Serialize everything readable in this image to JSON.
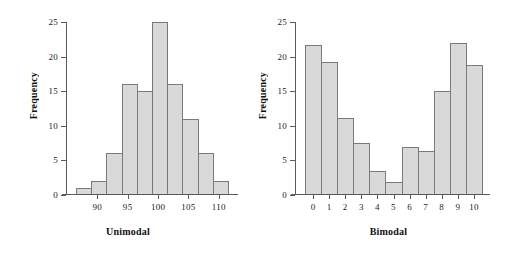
{
  "figure": {
    "background": "#ffffff",
    "bar_fill": "#d9d9d9",
    "bar_border": "#7a7a7a",
    "axis_color": "#5a5a5a"
  },
  "chart_data": [
    {
      "type": "bar",
      "title": "",
      "xlabel": "Unimodal",
      "ylabel": "Frequency",
      "ylim": [
        0,
        25
      ],
      "yticks": [
        0,
        5,
        10,
        15,
        20,
        25
      ],
      "ytick_labels": [
        "0",
        "5",
        "10",
        "15",
        "20",
        "25"
      ],
      "xlim": [
        86.5,
        111.5
      ],
      "xticks": [
        90,
        95,
        100,
        105,
        110
      ],
      "xtick_labels": [
        "90",
        "95",
        "100",
        "105",
        "110"
      ],
      "grid": false,
      "legend": null,
      "bin_edges": [
        86.5,
        89,
        91.5,
        94,
        96.5,
        99,
        101.5,
        104,
        106.5,
        109,
        111.5
      ],
      "categories": [
        "86.5-89",
        "89-91.5",
        "91.5-94",
        "94-96.5",
        "96.5-99",
        "99-101.5",
        "101.5-104",
        "104-106.5",
        "106.5-109",
        "109-111.5"
      ],
      "values": [
        1,
        2,
        6,
        16,
        15,
        25,
        16,
        11,
        6,
        2
      ]
    },
    {
      "type": "bar",
      "title": "",
      "xlabel": "Bimodal",
      "ylabel": "Frequency",
      "ylim": [
        0,
        25
      ],
      "yticks": [
        0,
        5,
        10,
        15,
        20,
        25
      ],
      "ytick_labels": [
        "0",
        "5",
        "10",
        "15",
        "20",
        "25"
      ],
      "xlim": [
        -0.5,
        10.5
      ],
      "xticks": [
        0,
        1,
        2,
        3,
        4,
        5,
        6,
        7,
        8,
        9,
        10
      ],
      "xtick_labels": [
        "0",
        "1",
        "2",
        "3",
        "4",
        "5",
        "6",
        "7",
        "8",
        "9",
        "10"
      ],
      "grid": false,
      "legend": null,
      "categories": [
        "0",
        "1",
        "2",
        "3",
        "4",
        "5",
        "6",
        "7",
        "8",
        "9",
        "10"
      ],
      "values": [
        21.7,
        19.2,
        11.2,
        7.5,
        3.4,
        1.9,
        7.0,
        6.4,
        15.0,
        22.0,
        18.8
      ]
    }
  ]
}
